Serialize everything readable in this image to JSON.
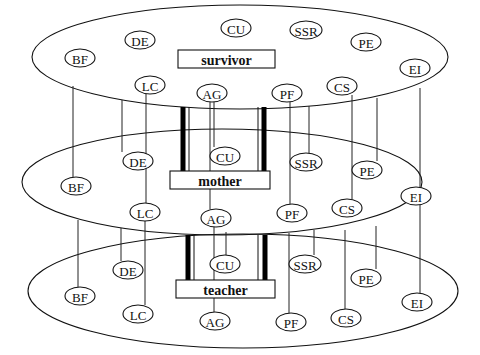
{
  "diagram": {
    "title": "",
    "layers": [
      {
        "id": "survivor",
        "label": "survivor",
        "ellipse": {
          "cx": 240,
          "cy": 57,
          "rx": 208,
          "ry": 52
        },
        "box": {
          "x": 178,
          "y": 50,
          "w": 97,
          "h": 18
        },
        "nodes": [
          {
            "label": "BF",
            "x": 80,
            "y": 58,
            "rx": 15,
            "ry": 9
          },
          {
            "label": "DE",
            "x": 140,
            "y": 40,
            "rx": 15,
            "ry": 9
          },
          {
            "label": "CU",
            "x": 236,
            "y": 28,
            "rx": 15,
            "ry": 9
          },
          {
            "label": "SSR",
            "x": 306,
            "y": 30,
            "rx": 16,
            "ry": 9
          },
          {
            "label": "PE",
            "x": 366,
            "y": 42,
            "rx": 15,
            "ry": 9
          },
          {
            "label": "EI",
            "x": 415,
            "y": 68,
            "rx": 15,
            "ry": 9
          },
          {
            "label": "LC",
            "x": 150,
            "y": 85,
            "rx": 15,
            "ry": 9
          },
          {
            "label": "AG",
            "x": 212,
            "y": 93,
            "rx": 15,
            "ry": 9
          },
          {
            "label": "PF",
            "x": 287,
            "y": 93,
            "rx": 15,
            "ry": 9
          },
          {
            "label": "CS",
            "x": 342,
            "y": 86,
            "rx": 15,
            "ry": 9
          }
        ]
      },
      {
        "id": "mother",
        "label": "mother",
        "ellipse": {
          "cx": 222,
          "cy": 182,
          "rx": 200,
          "ry": 53
        },
        "box": {
          "x": 170,
          "y": 171,
          "w": 100,
          "h": 18
        },
        "nodes": [
          {
            "label": "DE",
            "x": 138,
            "y": 161,
            "rx": 15,
            "ry": 9
          },
          {
            "label": "CU",
            "x": 225,
            "y": 156,
            "rx": 15,
            "ry": 9
          },
          {
            "label": "SSR",
            "x": 306,
            "y": 162,
            "rx": 16,
            "ry": 9
          },
          {
            "label": "PE",
            "x": 367,
            "y": 170,
            "rx": 15,
            "ry": 9
          },
          {
            "label": "EI",
            "x": 416,
            "y": 196,
            "rx": 15,
            "ry": 9
          },
          {
            "label": "BF",
            "x": 76,
            "y": 186,
            "rx": 15,
            "ry": 9
          },
          {
            "label": "LC",
            "x": 145,
            "y": 212,
            "rx": 15,
            "ry": 9
          },
          {
            "label": "AG",
            "x": 216,
            "y": 218,
            "rx": 15,
            "ry": 9
          },
          {
            "label": "PF",
            "x": 292,
            "y": 213,
            "rx": 15,
            "ry": 9
          },
          {
            "label": "CS",
            "x": 347,
            "y": 208,
            "rx": 15,
            "ry": 9
          }
        ]
      },
      {
        "id": "teacher",
        "label": "teacher",
        "ellipse": {
          "cx": 243,
          "cy": 291,
          "rx": 215,
          "ry": 57
        },
        "box": {
          "x": 176,
          "y": 280,
          "w": 99,
          "h": 18
        },
        "nodes": [
          {
            "label": "DE",
            "x": 128,
            "y": 270,
            "rx": 15,
            "ry": 9
          },
          {
            "label": "CU",
            "x": 225,
            "y": 264,
            "rx": 15,
            "ry": 9
          },
          {
            "label": "SSR",
            "x": 305,
            "y": 264,
            "rx": 16,
            "ry": 9
          },
          {
            "label": "PE",
            "x": 366,
            "y": 278,
            "rx": 15,
            "ry": 9
          },
          {
            "label": "EI",
            "x": 417,
            "y": 302,
            "rx": 15,
            "ry": 9
          },
          {
            "label": "BF",
            "x": 80,
            "y": 296,
            "rx": 15,
            "ry": 9
          },
          {
            "label": "LC",
            "x": 138,
            "y": 314,
            "rx": 15,
            "ry": 9
          },
          {
            "label": "AG",
            "x": 215,
            "y": 321,
            "rx": 15,
            "ry": 9
          },
          {
            "label": "PF",
            "x": 291,
            "y": 322,
            "rx": 15,
            "ry": 9
          },
          {
            "label": "CS",
            "x": 346,
            "y": 318,
            "rx": 15,
            "ry": 9
          }
        ]
      }
    ],
    "connectors": [
      {
        "from": "survivor-bottom",
        "x": 73,
        "y1": 86,
        "y2": 177
      },
      {
        "from": "survivor",
        "x": 122,
        "y1": 100,
        "y2": 152
      },
      {
        "from": "survivor",
        "x": 146,
        "y1": 94,
        "y2": 203
      },
      {
        "from": "survivor",
        "x": 210,
        "y1": 102,
        "y2": 209
      },
      {
        "from": "survivor",
        "x": 214,
        "y1": 102,
        "y2": 147
      },
      {
        "from": "survivor",
        "x": 290,
        "y1": 102,
        "y2": 204
      },
      {
        "from": "survivor",
        "x": 309,
        "y1": 106,
        "y2": 153
      },
      {
        "from": "survivor",
        "x": 352,
        "y1": 95,
        "y2": 199
      },
      {
        "from": "survivor",
        "x": 377,
        "y1": 98,
        "y2": 161
      },
      {
        "from": "survivor",
        "x": 420,
        "y1": 88,
        "y2": 187
      },
      {
        "from": "mother",
        "x": 78,
        "y1": 220,
        "y2": 287
      },
      {
        "from": "mother",
        "x": 121,
        "y1": 228,
        "y2": 261
      },
      {
        "from": "mother",
        "x": 145,
        "y1": 221,
        "y2": 305
      },
      {
        "from": "mother",
        "x": 214,
        "y1": 227,
        "y2": 312
      },
      {
        "from": "mother",
        "x": 226,
        "y1": 232,
        "y2": 255
      },
      {
        "from": "mother",
        "x": 289,
        "y1": 233,
        "y2": 313
      },
      {
        "from": "mother",
        "x": 314,
        "y1": 230,
        "y2": 255
      },
      {
        "from": "mother",
        "x": 345,
        "y1": 230,
        "y2": 309
      },
      {
        "from": "mother",
        "x": 376,
        "y1": 226,
        "y2": 269
      },
      {
        "from": "mother",
        "x": 420,
        "y1": 205,
        "y2": 293
      }
    ],
    "pillars": [
      {
        "between": "survivor-mother",
        "thick_x": [
          183,
          264
        ],
        "thin_x": [
          189,
          258
        ],
        "y1": 107,
        "y2": 171
      },
      {
        "between": "mother-teacher",
        "thick_x": [
          188,
          265
        ],
        "thin_x": [
          194,
          258
        ],
        "y1": 235,
        "y2": 280
      }
    ]
  }
}
